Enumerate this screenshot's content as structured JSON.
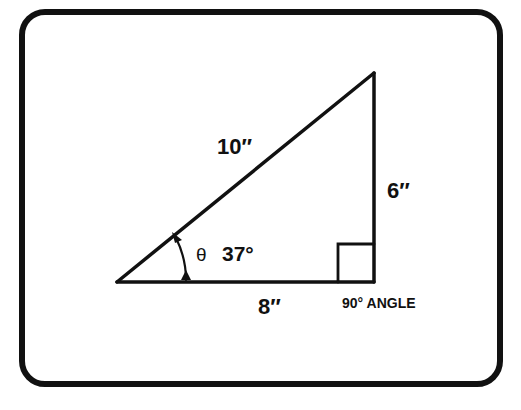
{
  "diagram": {
    "labels": {
      "hypotenuse": "10″",
      "opposite": "6″",
      "adjacent": "8″",
      "theta": "θ",
      "angle": "37°",
      "right_angle": "90° ANGLE"
    },
    "colors": {
      "stroke": "#111111",
      "background": "#ffffff"
    }
  }
}
